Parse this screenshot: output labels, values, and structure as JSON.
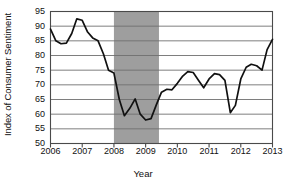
{
  "chart_data": {
    "type": "line",
    "title": "",
    "xlabel": "Year",
    "ylabel": "Index of Consumer Sentiment",
    "xlim": [
      2006,
      2013
    ],
    "ylim": [
      50,
      95
    ],
    "grid": true,
    "grid_axis": "y",
    "legend": "none",
    "line_color": "#111111",
    "series": [
      {
        "name": "Index of Consumer Sentiment",
        "x": [
          2006.0,
          2006.17,
          2006.33,
          2006.5,
          2006.67,
          2006.83,
          2007.0,
          2007.17,
          2007.33,
          2007.5,
          2007.67,
          2007.83,
          2008.0,
          2008.17,
          2008.33,
          2008.5,
          2008.67,
          2008.83,
          2009.0,
          2009.17,
          2009.33,
          2009.5,
          2009.67,
          2009.83,
          2010.0,
          2010.17,
          2010.33,
          2010.5,
          2010.67,
          2010.83,
          2011.0,
          2011.17,
          2011.33,
          2011.5,
          2011.67,
          2011.83,
          2012.0,
          2012.17,
          2012.33,
          2012.5,
          2012.67,
          2012.83,
          2013.0
        ],
        "values": [
          89.0,
          85.0,
          84.0,
          84.2,
          87.5,
          92.5,
          92.0,
          88.0,
          86.0,
          85.0,
          80.5,
          75.0,
          74.0,
          65.0,
          59.5,
          62.0,
          65.2,
          60.0,
          58.0,
          58.5,
          63.0,
          67.5,
          68.5,
          68.3,
          70.5,
          73.0,
          74.5,
          74.2,
          71.5,
          69.0,
          72.0,
          73.8,
          73.5,
          71.5,
          60.5,
          63.0,
          72.0,
          76.0,
          77.0,
          76.5,
          75.0,
          82.0,
          85.5
        ]
      }
    ],
    "y_ticks": [
      95,
      90,
      85,
      80,
      75,
      70,
      65,
      60,
      55,
      50
    ],
    "x_ticks": [
      2006,
      2007,
      2008,
      2009,
      2010,
      2011,
      2012,
      2013
    ],
    "x_tick_labels": [
      "2006",
      "2007",
      "2008",
      "2009",
      "2010",
      "2011",
      "2012",
      "2013"
    ],
    "y_tick_labels": [
      "95",
      "90",
      "85",
      "80",
      "75",
      "70",
      "65",
      "60",
      "55",
      "50"
    ],
    "shaded_regions": [
      {
        "name": "recession-band",
        "x_start": 2008.0,
        "x_end": 2009.42,
        "color": "#9e9e9e"
      }
    ]
  },
  "colors": {
    "background": "#ffffff",
    "line": "#111111",
    "grid": "#6f6f6f",
    "frame": "#4a4a4a",
    "shade": "#9e9e9e",
    "text": "#111111"
  }
}
